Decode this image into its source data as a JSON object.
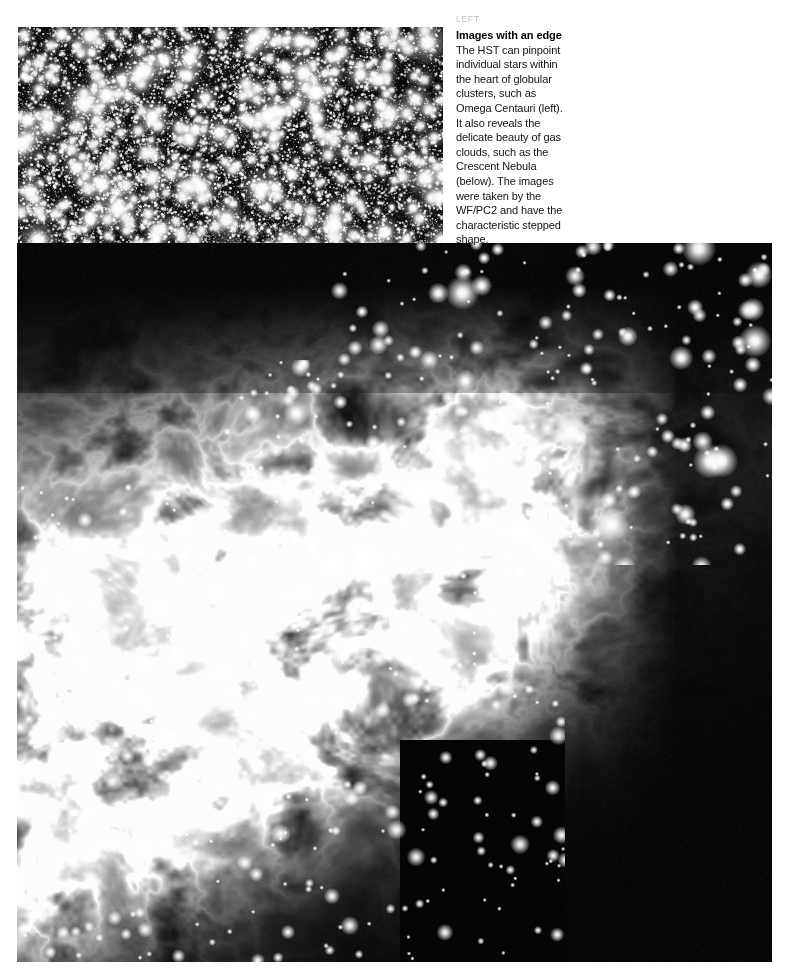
{
  "page": {
    "background_color": "#ffffff",
    "width": 791,
    "height": 980
  },
  "caption": {
    "kicker": "LEFT",
    "kicker_color": "#b9bcc0",
    "headline": "Images with an edge",
    "body": "The HST can pinpoint individual stars within the heart of globular clusters, such as Omega Centauri (left). It also reveals the delicate beauty of gas clouds, such as the Crescent Nebula (below). The images were taken by the WF/PC2 and have the characteristic stepped shape."
  },
  "figures": [
    {
      "id": "globular-cluster",
      "name": "Omega Centauri globular cluster",
      "instrument": "WF/PC2",
      "x": 18,
      "y": 27,
      "width": 425,
      "height": 456,
      "background_color": "#000000",
      "star_color": "#ffffff"
    },
    {
      "id": "crescent-nebula",
      "name": "Crescent Nebula",
      "instrument": "WF/PC2",
      "x": 17,
      "y": 243,
      "width": 755,
      "height": 719,
      "background_color": "#000000",
      "nebula_color": "#d8d8d8",
      "shape": "stepped"
    }
  ]
}
